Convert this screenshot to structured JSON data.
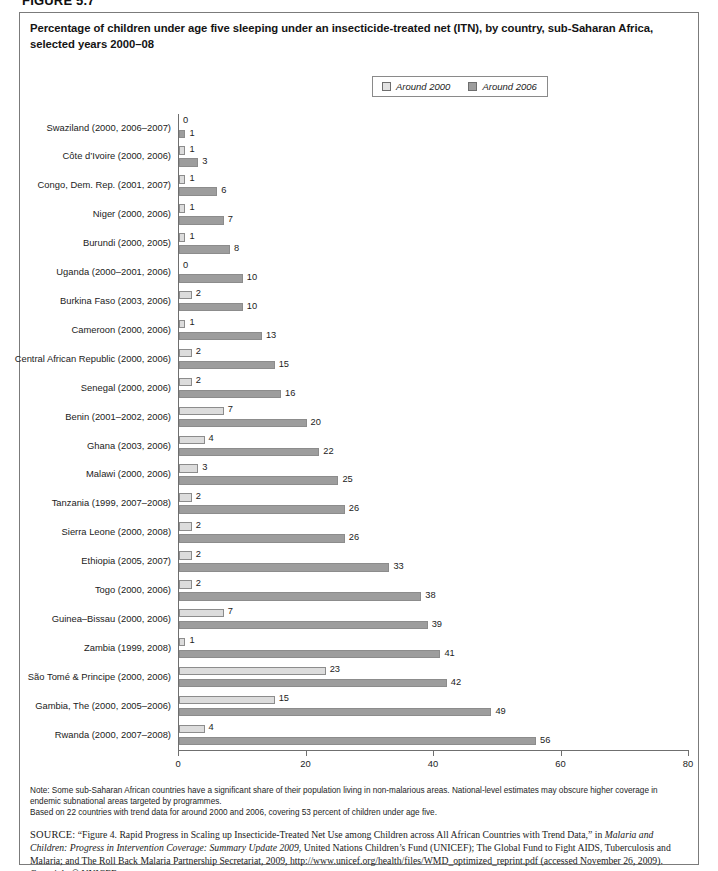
{
  "figure": {
    "number": "FIGURE 5.7",
    "title": "Percentage of children under age five sleeping under an insecticide-treated net (ITN), by country, sub-Saharan Africa, selected years 2000–08"
  },
  "legend": {
    "items": [
      {
        "label": "Around 2000",
        "color": "#dcdcdc",
        "icon": "legend-swatch-light"
      },
      {
        "label": "Around 2006",
        "color": "#9d9d9d",
        "icon": "legend-swatch-dark"
      }
    ]
  },
  "notes": {
    "line1": "Note: Some sub-Saharan African countries have a significant share of their population living in non-malarious areas. National-level estimates may obscure higher coverage in endemic subnational areas targeted by programmes.",
    "line2": "Based on 22 countries with trend data for around 2000 and 2006, covering 53 percent of children under age five."
  },
  "source": {
    "prefix": "SOURCE:",
    "part1": " “Figure 4. Rapid Progress in Scaling up Insecticide-Treated Net Use among Children across All African Countries with Trend Data,” in ",
    "italic1": "Malaria and Children: Progress in Intervention Coverage: Summary Update 2009",
    "part2": ", United Nations Children’s Fund (UNICEF); The Global Fund to Fight AIDS, Tuberculosis and Malaria; and The Roll Back Malaria Partnership Secretariat, 2009, http://www.unicef.org/health/files/WMD_optimized_reprint.pdf (accessed November 26, 2009). Copyright © UNICEF."
  },
  "chart_data": {
    "type": "bar",
    "orientation": "horizontal",
    "title": "Percentage of children under age five sleeping under an insecticide-treated net (ITN), by country, sub-Saharan Africa, selected years 2000–08",
    "xlabel": "",
    "ylabel": "",
    "xlim": [
      0,
      80
    ],
    "xticks": [
      0,
      20,
      40,
      60,
      80
    ],
    "grid": false,
    "legend_position": "top-center",
    "categories": [
      "Swaziland (2000, 2006–2007)",
      "Côte d’Ivoire (2000, 2006)",
      "Congo, Dem. Rep. (2001, 2007)",
      "Niger (2000, 2006)",
      "Burundi (2000, 2005)",
      "Uganda (2000–2001, 2006)",
      "Burkina Faso (2003, 2006)",
      "Cameroon (2000, 2006)",
      "Central African Republic (2000, 2006)",
      "Senegal (2000, 2006)",
      "Benin (2001–2002, 2006)",
      "Ghana (2003, 2006)",
      "Malawi (2000, 2006)",
      "Tanzania (1999, 2007–2008)",
      "Sierra Leone (2000, 2008)",
      "Ethiopia (2005, 2007)",
      "Togo (2000, 2006)",
      "Guinea–Bissau (2000, 2006)",
      "Zambia (1999, 2008)",
      "São Tomé & Principe (2000, 2006)",
      "Gambia, The (2000, 2005–2006)",
      "Rwanda (2000, 2007–2008)"
    ],
    "series": [
      {
        "name": "Around 2000",
        "color": "#dcdcdc",
        "values": [
          0,
          1,
          1,
          1,
          1,
          0,
          2,
          1,
          2,
          2,
          7,
          4,
          3,
          2,
          2,
          2,
          2,
          7,
          1,
          23,
          15,
          4
        ]
      },
      {
        "name": "Around 2006",
        "color": "#9d9d9d",
        "values": [
          1,
          3,
          6,
          7,
          8,
          10,
          10,
          13,
          15,
          16,
          20,
          22,
          25,
          26,
          26,
          33,
          38,
          39,
          41,
          42,
          49,
          56
        ]
      }
    ]
  }
}
